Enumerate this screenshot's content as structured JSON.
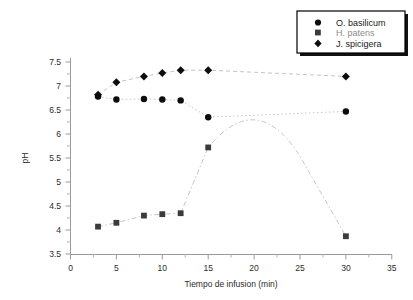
{
  "chart_data": {
    "type": "scatter",
    "title": "",
    "xlabel": "Tiempo de infusion (min)",
    "ylabel": "pH",
    "xlim": [
      0,
      35
    ],
    "ylim": [
      3.5,
      7.5
    ],
    "xticks": [
      0,
      5,
      10,
      15,
      20,
      25,
      30,
      35
    ],
    "yticks": [
      3.5,
      4,
      4.5,
      5,
      5.5,
      6,
      6.5,
      7,
      7.5
    ],
    "xtick_labels": [
      "0",
      "5",
      "10",
      "15",
      "20",
      "25",
      "30",
      "35"
    ],
    "ytick_labels": [
      "3.5",
      "4",
      "4.5",
      "5",
      "5.5",
      "6",
      "6.5",
      "7",
      "7.5"
    ],
    "grid": false,
    "legend_position": "top-right",
    "series": [
      {
        "name": "O. basilicum",
        "marker": "circle",
        "color": "#0d0d0d",
        "x": [
          3,
          5,
          8,
          10,
          12,
          15,
          30
        ],
        "values": [
          6.78,
          6.72,
          6.73,
          6.72,
          6.7,
          6.35,
          6.47
        ]
      },
      {
        "name": "H. patens",
        "marker": "square",
        "color": "#3b3b3b",
        "x": [
          3,
          5,
          8,
          10,
          12,
          15,
          30
        ],
        "values": [
          4.07,
          4.15,
          4.3,
          4.33,
          4.35,
          5.72,
          3.87
        ],
        "curve_peak": {
          "x": 20.5,
          "y": 6.7
        }
      },
      {
        "name": "J. spicigera",
        "marker": "diamond",
        "color": "#0d0d0d",
        "x": [
          3,
          5,
          8,
          10,
          12,
          15,
          30
        ],
        "values": [
          6.82,
          7.08,
          7.2,
          7.27,
          7.33,
          7.33,
          7.2
        ]
      }
    ]
  },
  "axes": {
    "x_title": "Tiempo de infusion (min)",
    "y_title": "pH"
  },
  "legend": {
    "entries": [
      {
        "label": "O. basilicum",
        "marker": "circle"
      },
      {
        "label": "H. patens",
        "marker": "square"
      },
      {
        "label": "J. spicigera",
        "marker": "diamond"
      }
    ]
  }
}
